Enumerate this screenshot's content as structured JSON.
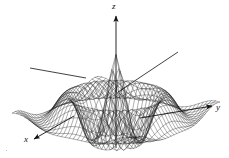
{
  "figure": {
    "title": "",
    "kind": "3d-surface-wireframe",
    "background": "#ffffff",
    "line_color": "#1a1a1a",
    "width": 229,
    "height": 158
  },
  "axes": {
    "z": {
      "label": "z",
      "name": "z-axis",
      "direction": "up",
      "arrow": true
    },
    "y": {
      "label": "y",
      "name": "y-axis",
      "direction": "right",
      "arrow": true
    },
    "x": {
      "label": "x",
      "name": "x-axis",
      "direction": "down-left",
      "arrow": true
    }
  },
  "guide_lines": [
    {
      "name": "left-guide-line",
      "from": [
        30,
        68
      ],
      "to": [
        86,
        78
      ],
      "arrow": false
    },
    {
      "name": "right-guide-line",
      "from": [
        118,
        92
      ],
      "to": [
        178,
        52
      ],
      "arrow": false
    }
  ],
  "chart_data": {
    "type": "surface",
    "title": "",
    "xlabel": "x",
    "ylabel": "y",
    "zlabel": "z",
    "surface_equation": "z = cos(r) * exp(-r/5), r = sqrt(x^2 + y^2)",
    "grid": true,
    "mesh_u_lines": 31,
    "mesh_v_lines": 31,
    "x_range": [
      -9,
      9
    ],
    "y_range": [
      -9,
      9
    ],
    "z_range": [
      -1,
      1
    ],
    "projection": {
      "type": "oblique-perspective",
      "elevation_deg": 22,
      "azimuth_deg": 35
    },
    "features": [
      {
        "name": "central-peak",
        "position": [
          0,
          0
        ],
        "z": 1.0
      },
      {
        "name": "inner-trough-ring",
        "radius": 3.14,
        "z": -0.55
      },
      {
        "name": "outer-crest-ring",
        "radius": 6.28,
        "z": 0.34
      }
    ],
    "legend": null,
    "tick_labels": []
  }
}
